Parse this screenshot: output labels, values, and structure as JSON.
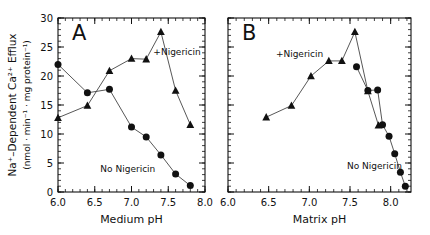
{
  "figure": {
    "ylabel_line1": "Na⁺–Dependent Ca²⁺ Efflux",
    "ylabel_line2": "(nmol · min⁻¹ · mg protein⁻¹)",
    "background": "#ffffff",
    "ink": "#111111"
  },
  "chart_data": [
    {
      "type": "line",
      "panel": "A",
      "title": "A",
      "xlabel": "Medium pH",
      "ylabel": "Na⁺–Dependent Ca²⁺ Efflux (nmol · min⁻¹ · mg protein⁻¹)",
      "xlim": [
        6.0,
        8.0
      ],
      "ylim": [
        0,
        30
      ],
      "xticks": [
        6.0,
        6.5,
        7.0,
        7.5,
        8.0
      ],
      "xticklabels": [
        "6.0",
        "6.5",
        "7.0",
        "7.5",
        "8.0"
      ],
      "yticks": [
        0,
        5,
        10,
        15,
        20,
        25,
        30
      ],
      "yticklabels": [
        "0",
        "5",
        "10",
        "15",
        "20",
        "25",
        "30"
      ],
      "xminor_step": 0.1,
      "yminor_step": 1,
      "grid": false,
      "legend": "annotations",
      "series": [
        {
          "name": "+Nigericin",
          "marker": "triangle",
          "annotation": "+Nigericin",
          "annotation_x": 7.62,
          "annotation_y": 23.6,
          "x": [
            6.0,
            6.4,
            6.7,
            7.0,
            7.2,
            7.4,
            7.6,
            7.8
          ],
          "y": [
            12.8,
            14.9,
            20.9,
            23.0,
            22.9,
            27.6,
            17.5,
            11.6
          ]
        },
        {
          "name": "No Nigericin",
          "marker": "circle",
          "annotation": "No Nigericin",
          "annotation_x": 6.95,
          "annotation_y": 3.4,
          "x": [
            6.0,
            6.4,
            6.7,
            7.0,
            7.2,
            7.4,
            7.6,
            7.8
          ],
          "y": [
            22.0,
            17.1,
            17.7,
            11.2,
            9.5,
            6.4,
            3.1,
            1.1
          ]
        }
      ]
    },
    {
      "type": "line",
      "panel": "B",
      "title": "B",
      "xlabel": "Matrix pH",
      "ylabel": "Na⁺–Dependent Ca²⁺ Efflux (nmol · min⁻¹ · mg protein⁻¹)",
      "xlim": [
        6.0,
        8.25
      ],
      "ylim": [
        0,
        30
      ],
      "xticks": [
        6.0,
        6.5,
        7.0,
        7.5,
        8.0
      ],
      "xticklabels": [
        "6.0",
        "6.5",
        "7.0",
        "7.5",
        "8.0"
      ],
      "yticks": [
        0,
        5,
        10,
        15,
        20,
        25,
        30
      ],
      "yticklabels": [
        "",
        "",
        "",
        "",
        "",
        "",
        ""
      ],
      "xminor_step": 0.1,
      "yminor_step": 1,
      "grid": false,
      "legend": "annotations",
      "series": [
        {
          "name": "+Nigericin",
          "marker": "triangle",
          "annotation": "+Nigericin",
          "annotation_x": 6.88,
          "annotation_y": 23.3,
          "x": [
            6.47,
            6.78,
            7.02,
            7.24,
            7.4,
            7.56,
            7.72,
            7.85
          ],
          "y": [
            12.9,
            14.9,
            20.0,
            22.6,
            22.6,
            27.6,
            17.4,
            11.5
          ]
        },
        {
          "name": "No Nigericin",
          "marker": "circle",
          "annotation": "No Nigericin",
          "annotation_x": 7.8,
          "annotation_y": 3.9,
          "x": [
            7.58,
            7.72,
            7.84,
            7.9,
            7.98,
            8.05,
            8.12,
            8.18
          ],
          "y": [
            21.6,
            17.5,
            17.6,
            11.6,
            9.6,
            6.6,
            3.4,
            1.0
          ]
        }
      ]
    }
  ]
}
